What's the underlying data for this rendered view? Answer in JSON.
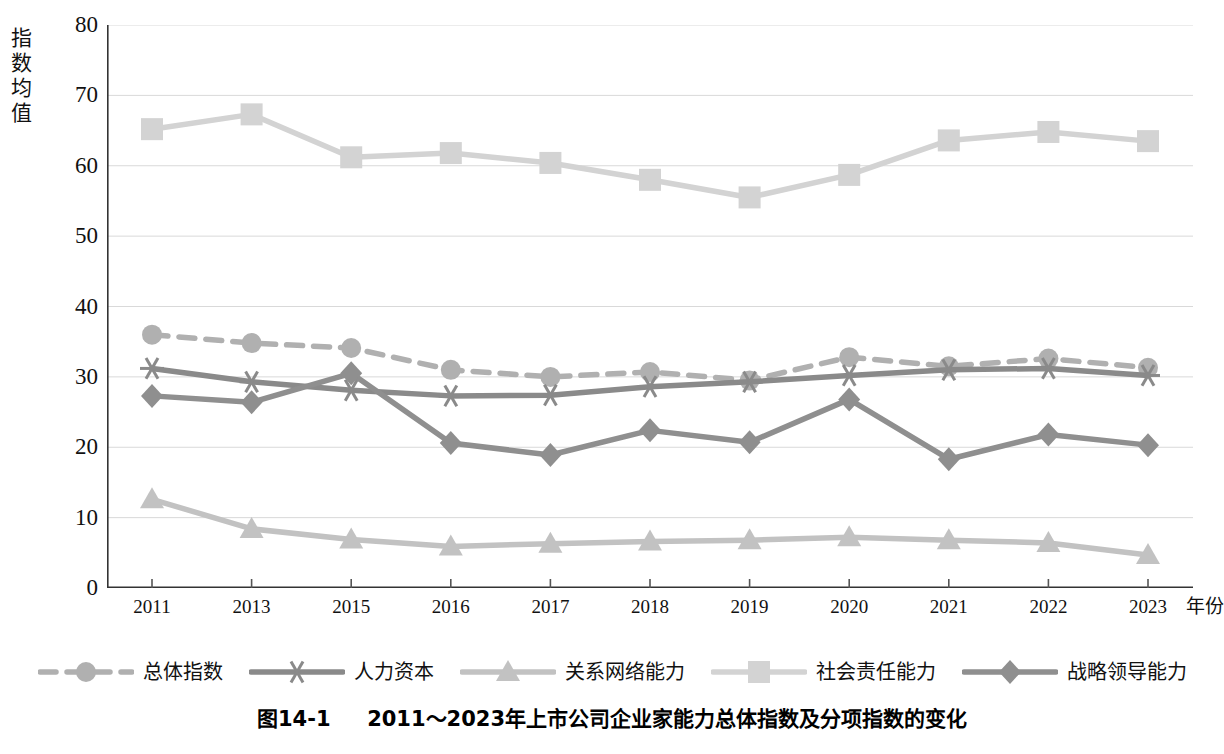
{
  "axis": {
    "y_title": "指数均值",
    "y_title_chars": [
      "指",
      "数",
      "均",
      "值"
    ],
    "y_ticks": [
      80,
      70,
      60,
      50,
      40,
      30,
      20,
      10,
      0
    ],
    "x_unit_label": "年份"
  },
  "caption": {
    "number": "图14-1",
    "text": "2011～2023年上市公司企业家能力总体指数及分项指数的变化"
  },
  "legend": {
    "position": "bottom",
    "items": [
      {
        "label": "总体指数",
        "marker": "circle",
        "dash": true,
        "color": "#b0b0b0"
      },
      {
        "label": "人力资本",
        "marker": "asterisk",
        "dash": false,
        "color": "#8a8a8a"
      },
      {
        "label": "关系网络能力",
        "marker": "triangle",
        "dash": false,
        "color": "#c2c2c2"
      },
      {
        "label": "社会责任能力",
        "marker": "square",
        "dash": false,
        "color": "#d3d3d3"
      },
      {
        "label": "战略领导能力",
        "marker": "diamond",
        "dash": false,
        "color": "#8f8f8f"
      }
    ]
  },
  "chart_data": {
    "type": "line",
    "title": "",
    "xlabel": "年份",
    "ylabel": "指数均值",
    "ylim": [
      0,
      80
    ],
    "ytick_step": 10,
    "grid": true,
    "categories": [
      "2011",
      "2013",
      "2015",
      "2016",
      "2017",
      "2018",
      "2019",
      "2020",
      "2021",
      "2022",
      "2023"
    ],
    "series": [
      {
        "name": "总体指数",
        "marker": "circle",
        "dash": true,
        "color": "#b0b0b0",
        "values": [
          36.0,
          34.8,
          34.1,
          31.0,
          30.0,
          30.7,
          29.5,
          32.8,
          31.5,
          32.6,
          31.3
        ]
      },
      {
        "name": "人力资本",
        "marker": "asterisk",
        "dash": false,
        "color": "#8a8a8a",
        "values": [
          31.2,
          29.3,
          28.1,
          27.3,
          27.4,
          28.6,
          29.3,
          30.2,
          31.0,
          31.2,
          30.2
        ]
      },
      {
        "name": "关系网络能力",
        "marker": "triangle",
        "dash": false,
        "color": "#c2c2c2",
        "values": [
          12.6,
          8.4,
          6.9,
          5.9,
          6.3,
          6.6,
          6.8,
          7.2,
          6.8,
          6.4,
          4.7
        ]
      },
      {
        "name": "社会责任能力",
        "marker": "square",
        "dash": false,
        "color": "#d3d3d3",
        "values": [
          65.2,
          67.3,
          61.2,
          61.8,
          60.4,
          58.0,
          55.5,
          58.7,
          63.6,
          64.8,
          63.5
        ]
      },
      {
        "name": "战略领导能力",
        "marker": "diamond",
        "dash": false,
        "color": "#8f8f8f",
        "values": [
          27.3,
          26.4,
          30.5,
          20.6,
          18.9,
          22.4,
          20.7,
          26.8,
          18.3,
          21.8,
          20.3
        ]
      }
    ]
  }
}
